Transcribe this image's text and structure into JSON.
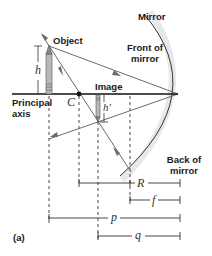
{
  "labels": {
    "object": "Object",
    "image": "Image",
    "mirror": "Mirror",
    "front_of_mirror_line1": "Front of",
    "front_of_mirror_line2": "mirror",
    "back_of_mirror_line1": "Back of",
    "back_of_mirror_line2": "mirror",
    "principal_axis_line1": "Principal",
    "principal_axis_line2": "axis",
    "center_of_curvature": "C",
    "object_height": "h",
    "image_height": "h′",
    "figure_label": "(a)"
  },
  "dimensions": {
    "radius": "R",
    "focal_length": "f",
    "object_distance": "p",
    "image_distance": "q"
  },
  "colors": {
    "axis": "#111111",
    "rays": "#6b6b6b",
    "mirror_line": "#333333",
    "mirror_shade": "#e6e6e6",
    "arrow_fill": "#b0b0b0",
    "dashed": "#333333"
  }
}
